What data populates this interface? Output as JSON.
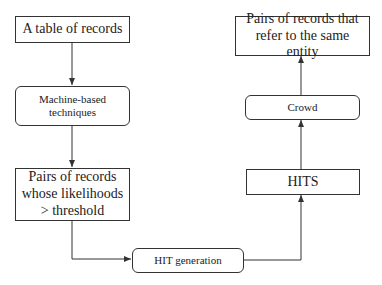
{
  "diagram": {
    "type": "flowchart",
    "nodes": [
      {
        "id": "table",
        "label": "A table of records",
        "shape": "rectangle"
      },
      {
        "id": "machine",
        "label": "Machine-based techniques",
        "shape": "rounded"
      },
      {
        "id": "pairs_threshold",
        "label": "Pairs of records whose likelihoods > threshold",
        "shape": "rectangle"
      },
      {
        "id": "hit_generation",
        "label": "HIT generation",
        "shape": "rounded"
      },
      {
        "id": "hits",
        "label": "HITS",
        "shape": "rectangle"
      },
      {
        "id": "crowd",
        "label": "Crowd",
        "shape": "rounded"
      },
      {
        "id": "result",
        "label": "Pairs of records that refer to the same entity",
        "shape": "rectangle"
      }
    ],
    "edges": [
      {
        "from": "table",
        "to": "machine"
      },
      {
        "from": "machine",
        "to": "pairs_threshold"
      },
      {
        "from": "pairs_threshold",
        "to": "hit_generation"
      },
      {
        "from": "hit_generation",
        "to": "hits"
      },
      {
        "from": "hits",
        "to": "crowd"
      },
      {
        "from": "crowd",
        "to": "result"
      }
    ]
  },
  "labels": {
    "table": "A table of records",
    "machine": "Machine-based techniques",
    "pairs_threshold": "Pairs of records whose likelihoods > threshold",
    "hit_generation": "HIT generation",
    "hits": "HITS",
    "crowd": "Crowd",
    "result": "Pairs of records that refer to the same entity"
  },
  "colors": {
    "stroke": "#333333",
    "background": "#ffffff"
  }
}
